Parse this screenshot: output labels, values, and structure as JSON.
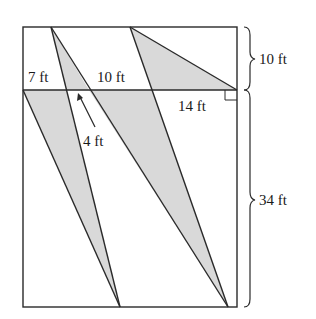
{
  "diagram": {
    "colors": {
      "shade": "#d9d9d9",
      "line": "#2a2a2a",
      "background": "#ffffff"
    },
    "labels": {
      "top_left_segment": "7 ft",
      "top_middle_segment": "10 ft",
      "arrow_segment": "4 ft",
      "right_segment": "14 ft",
      "upper_height": "10 ft",
      "lower_height": "34 ft"
    },
    "shapes": [
      {
        "name": "upper-left-shaded-triangle",
        "points": "51,27 66,90 89,90"
      },
      {
        "name": "upper-right-shaded-triangle",
        "points": "130,27 152,90 237,90"
      },
      {
        "name": "lower-left-shaded-triangle",
        "points": "23,90 66,90 120,307"
      },
      {
        "name": "lower-middle-shaded-triangle",
        "points": "89,90 152,90 228,307"
      }
    ]
  }
}
